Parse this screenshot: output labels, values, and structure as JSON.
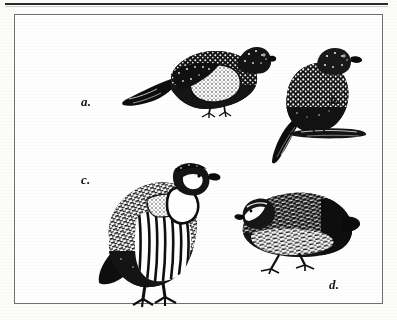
{
  "page": {
    "background_color": "#fcfcfb",
    "rule_color": "#2a2a2a",
    "frame_border_color": "#6f6f70",
    "ink_color": "#161616"
  },
  "figure": {
    "caption_labels": [
      {
        "key": "a",
        "text": "a.",
        "subject": "sandgrouse-standing-left-profile"
      },
      {
        "key": "b",
        "text": "b.",
        "subject": "sandgrouse-perched-upright"
      },
      {
        "key": "c",
        "text": "c.",
        "subject": "chukar-partridge-standing"
      },
      {
        "key": "d",
        "text": "d.",
        "subject": "quail-standing-facing-left"
      }
    ],
    "birds": [
      {
        "id": "bird-a",
        "label": "a.",
        "description": "Spotted pigeon-like sandgrouse in left profile, dark pointed tail to the left, pale speckled breast, head and bill to the right",
        "facing": "right"
      },
      {
        "id": "bird-b",
        "label": "b.",
        "description": "Upright perched sandgrouse, mottled plumage, long dark tail angled to the lower left, perched on a short branch",
        "facing": "right"
      },
      {
        "id": "bird-c",
        "label": "c.",
        "description": "Chukar partridge with white throat bordered by a black collar, boldly barred flanks, standing on two legs",
        "facing": "right"
      },
      {
        "id": "bird-d",
        "label": "d.",
        "description": "Plump quail with streaked plumage, short bill, standing on two legs",
        "facing": "left"
      }
    ]
  }
}
